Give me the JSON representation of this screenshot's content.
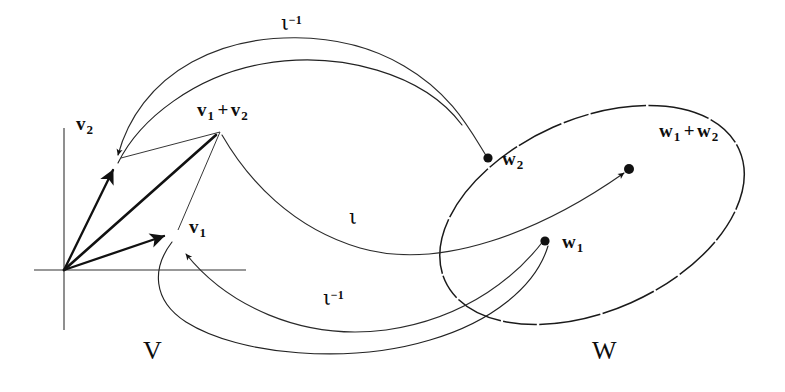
{
  "figure": {
    "background_color": "#ffffff",
    "stroke_color": "#1a1a1a",
    "width": 785,
    "height": 392
  },
  "spaces": {
    "domain": {
      "name": "V",
      "label": "V",
      "shape": "ellipse",
      "center_x": 250,
      "center_y": 185,
      "radius_x": 215,
      "radius_y": 133
    },
    "codomain": {
      "name": "W",
      "label": "W",
      "shape": "ellipse",
      "center_x": 592,
      "center_y": 215,
      "radius_x": 160,
      "radius_y": 96,
      "rotation_degrees": -24
    }
  },
  "axes": {
    "name": "coordinate-axes",
    "origin_x": 64,
    "origin_y": 270,
    "x_axis_label": "",
    "y_axis_label": ""
  },
  "vectors": [
    {
      "id": "v2",
      "label": "v",
      "subscript": "2",
      "label_x": 76,
      "label_y": 114,
      "from_x": 64,
      "from_y": 270,
      "to_x": 115,
      "to_y": 166
    },
    {
      "id": "v1",
      "label": "v",
      "subscript": "1",
      "label_x": 188,
      "label_y": 218,
      "from_x": 64,
      "from_y": 270,
      "to_x": 167,
      "to_y": 235
    },
    {
      "id": "v1plusv2",
      "label": "v",
      "subscript": "1",
      "label_x": 197,
      "label_y": 100,
      "from_x": 64,
      "from_y": 270,
      "to_x": 220,
      "to_y": 132
    }
  ],
  "labels": {
    "v2": {
      "base": "v",
      "sub": "2"
    },
    "v1": {
      "base": "v",
      "sub": "1"
    },
    "v_sum": {
      "first": "v",
      "first_sub": "1",
      "operator": "+",
      "second": "v",
      "second_sub": "2"
    },
    "w2": {
      "base": "w",
      "sub": "2"
    },
    "w1": {
      "base": "w",
      "sub": "1"
    },
    "w_sum": {
      "first": "w",
      "first_sub": "1",
      "operator": "+",
      "second": "w",
      "second_sub": "2"
    },
    "space_v": "V",
    "space_w": "W",
    "map_forward": {
      "symbol": "ι",
      "exponent": ""
    },
    "map_inverse_top": {
      "symbol": "ι",
      "exponent": "−1"
    },
    "map_inverse_bottom": {
      "symbol": "ι",
      "exponent": "−1"
    }
  },
  "points": [
    {
      "id": "w2",
      "x": 488,
      "y": 158,
      "label": "w",
      "subscript": "2",
      "label_x": 504,
      "label_y": 150
    },
    {
      "id": "w1",
      "x": 545,
      "y": 241,
      "label": "w",
      "subscript": "1",
      "label_x": 563,
      "label_y": 233
    },
    {
      "id": "w1plusw2",
      "x": 629,
      "y": 169,
      "label": "w",
      "subscript": "1",
      "label_x": 660,
      "label_y": 122
    }
  ],
  "maps": [
    {
      "id": "iota-inverse-top",
      "symbol": "ι",
      "exponent": "−1",
      "label_x": 282,
      "label_y": 14,
      "direction": "W-to-V",
      "from_point": "w2",
      "to_point": "v2"
    },
    {
      "id": "iota-forward",
      "symbol": "ι",
      "exponent": "",
      "label_x": 349,
      "label_y": 208,
      "direction": "V-to-W",
      "from_point": "v1plusv2",
      "to_point": "w1plusw2"
    },
    {
      "id": "iota-inverse-bottom",
      "symbol": "ι",
      "exponent": "−1",
      "label_x": 324,
      "label_y": 289,
      "direction": "W-to-V",
      "from_point": "w1",
      "to_point": "v1"
    }
  ],
  "space_label_positions": {
    "v_x": 143,
    "v_y": 338,
    "w_x": 593,
    "w_y": 338
  }
}
